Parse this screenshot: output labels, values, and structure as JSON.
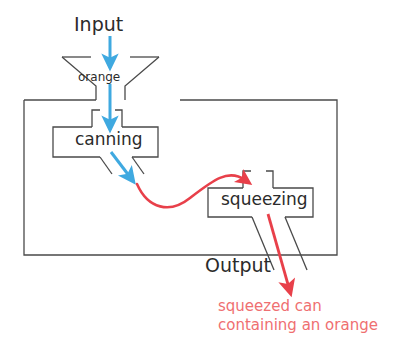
{
  "diagram": {
    "title_visible": false,
    "labels": {
      "input": "Input",
      "orange": "orange",
      "canning": "canning",
      "squeezing": "squeezing",
      "output": "Output"
    },
    "caption": {
      "line1": "squeezed can",
      "line2": "containing an orange"
    },
    "colors": {
      "outline": "#4a4a4a",
      "text": "#2b2b2b",
      "blue_arrow": "#3fa9e0",
      "red_arrow": "#e8404a",
      "red_text": "#ef6f71",
      "background": "#ffffff"
    },
    "icons": {
      "input_arrow": "arrow-down-icon",
      "canning_in_arrow": "arrow-down-icon",
      "canning_out_arrow": "arrow-down-right-icon",
      "transfer_curve": "s-curve-arrow-icon",
      "output_arrow": "arrow-down-right-icon"
    },
    "nodes": [
      {
        "id": "hopper",
        "label": "orange",
        "shape": "funnel"
      },
      {
        "id": "canning",
        "label": "canning",
        "shape": "notched-box"
      },
      {
        "id": "squeezing",
        "label": "squeezing",
        "shape": "notched-box"
      }
    ],
    "flows": [
      {
        "from": "input",
        "to": "hopper",
        "color": "blue"
      },
      {
        "from": "hopper",
        "to": "canning",
        "color": "blue"
      },
      {
        "from": "canning",
        "to": "squeezing",
        "color": "red"
      },
      {
        "from": "squeezing",
        "to": "output",
        "color": "red"
      }
    ]
  }
}
